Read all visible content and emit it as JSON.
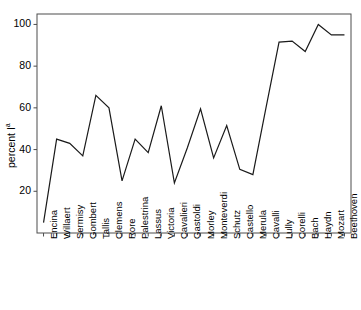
{
  "chart_data": {
    "type": "line",
    "title": "",
    "xlabel": "",
    "ylabel": "percent I",
    "ylabel_superscript": "a",
    "ylim": [
      0,
      105
    ],
    "xlim": [
      -0.5,
      23.5
    ],
    "grid": false,
    "legend": null,
    "yticks": [
      20,
      40,
      60,
      80,
      100
    ],
    "ytick_labels": [
      "20",
      "40",
      "60",
      "80",
      "100"
    ],
    "categories": [
      "Encina",
      "Willaert",
      "Sermisy",
      "Gombert",
      "Tallis",
      "Clemens",
      "Rore",
      "Palestrina",
      "Lassus",
      "Victoria",
      "Cavalieri",
      "Gastoldi",
      "Morley",
      "Monteverdi",
      "Schutz",
      "Castello",
      "Merula",
      "Cavalli",
      "Lully",
      "Corelli",
      "Bach",
      "Haydn",
      "Mozart",
      "Beethoven"
    ],
    "values": [
      5,
      45,
      43,
      37,
      66,
      60,
      25,
      45,
      38.5,
      61,
      24,
      41,
      59.5,
      36,
      51.5,
      30.5,
      28,
      60,
      91.5,
      92,
      87,
      100,
      95,
      95
    ],
    "line_color": "#1a1a1a",
    "line_width": 1.2,
    "axis_color": "#4d4d4d",
    "background_color": "#ffffff"
  }
}
